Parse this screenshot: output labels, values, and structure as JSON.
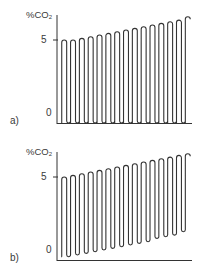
{
  "chart_data": [
    {
      "type": "line",
      "panel_label": "a)",
      "title": "",
      "ylabel": "%CO2",
      "ylabel_main": "%CO",
      "ylabel_sub": "2",
      "xlabel": "",
      "y_ticks": [
        "0",
        "5"
      ],
      "tick_5": "5",
      "tick_0": "0",
      "ylim": [
        0,
        6.5
      ],
      "grid": false,
      "legend": null,
      "description": "Capnogram: 15 breath cycles, baseline stays at 0, end-tidal peaks rise gradually",
      "cycles": 15,
      "peaks": [
        5.0,
        5.0,
        5.1,
        5.2,
        5.3,
        5.4,
        5.5,
        5.6,
        5.7,
        5.8,
        5.9,
        6.0,
        6.1,
        6.2,
        6.4
      ],
      "troughs": [
        0,
        0,
        0,
        0,
        0,
        0,
        0,
        0,
        0,
        0,
        0,
        0,
        0,
        0,
        0
      ]
    },
    {
      "type": "line",
      "panel_label": "b)",
      "title": "",
      "ylabel": "%CO2",
      "ylabel_main": "%CO",
      "ylabel_sub": "2",
      "xlabel": "",
      "y_ticks": [
        "0",
        "5"
      ],
      "tick_5": "5",
      "tick_0": "0",
      "ylim": [
        0,
        6.5
      ],
      "grid": false,
      "legend": null,
      "description": "Capnogram: 15 breath cycles, baseline (inspired CO2) rises and end-tidal peaks rise gradually",
      "cycles": 15,
      "peaks": [
        5.0,
        5.1,
        5.2,
        5.3,
        5.4,
        5.5,
        5.6,
        5.7,
        5.8,
        5.9,
        6.0,
        6.1,
        6.2,
        6.3,
        6.4
      ],
      "troughs": [
        0.2,
        0.3,
        0.4,
        0.5,
        0.6,
        0.7,
        0.8,
        0.9,
        1.0,
        1.1,
        1.3,
        1.4,
        1.5,
        1.7,
        1.9
      ]
    }
  ],
  "colors": {
    "trace": "#333333",
    "axis": "#333333",
    "background": "#ffffff"
  }
}
